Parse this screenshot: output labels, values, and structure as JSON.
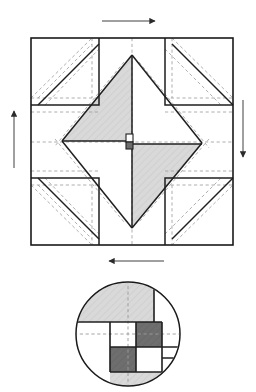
{
  "figure": {
    "title": "Quilt block piecing diagram with rotation arrows and circular detail inset",
    "width": 256,
    "height": 392,
    "background_color": "#ffffff"
  },
  "colors": {
    "outline": "#1a1a1a",
    "seam_solid": "#2b2b2b",
    "seam_dashed": "#8c8c8c",
    "fabric_light": "#ffffff",
    "fabric_medium": "#d9d9d9",
    "fabric_dark": "#6e6e6e",
    "arrow": "#2b2b2b",
    "hatch": "#c2c2c2"
  },
  "main_block": {
    "name": "pinwheel-square-in-a-square-block",
    "x": 31,
    "y": 38,
    "width": 202,
    "height": 207,
    "grid_divisions": 3,
    "outline_width": 1.6,
    "grid_lines": {
      "vertical_x": [
        99,
        165
      ],
      "horizontal_y": [
        105,
        178
      ]
    },
    "center_marks": {
      "vertical_x": 132,
      "horizontal_y": 142
    },
    "units": [
      {
        "name": "corner-unit-top-left",
        "x": 31,
        "y": 38,
        "w": 68,
        "h": 67,
        "type": "half-square-triangle",
        "diagonal": "bottom-left-to-top-right",
        "fill": "#ffffff"
      },
      {
        "name": "corner-unit-top-right",
        "x": 165,
        "y": 38,
        "w": 68,
        "h": 67,
        "type": "half-square-triangle",
        "diagonal": "top-left-to-bottom-right",
        "fill": "#ffffff"
      },
      {
        "name": "corner-unit-bottom-left",
        "x": 31,
        "y": 178,
        "w": 68,
        "h": 67,
        "type": "half-square-triangle",
        "diagonal": "top-left-to-bottom-right",
        "fill": "#ffffff"
      },
      {
        "name": "corner-unit-bottom-right",
        "x": 165,
        "y": 178,
        "w": 68,
        "h": 67,
        "type": "half-square-triangle",
        "diagonal": "bottom-left-to-top-right",
        "fill": "#ffffff"
      },
      {
        "name": "shaded-triangle-upper",
        "type": "large-triangle",
        "fill": "#d9d9d9",
        "points": "132,55 132,141 62,141"
      },
      {
        "name": "shaded-triangle-lower",
        "type": "large-triangle",
        "fill": "#d9d9d9",
        "points": "132,144 202,144 132,228"
      },
      {
        "name": "center-square-on-point",
        "type": "square-on-point",
        "fill": "#ffffff",
        "points": "132,55 202,143 132,228 62,141"
      },
      {
        "name": "center-patch-light",
        "type": "tiny-square",
        "x": 126,
        "y": 134,
        "w": 7,
        "h": 8,
        "fill": "#ffffff"
      },
      {
        "name": "center-patch-dark",
        "type": "tiny-square",
        "x": 126,
        "y": 142,
        "w": 7,
        "h": 7,
        "fill": "#6e6e6e"
      }
    ]
  },
  "arrows": [
    {
      "name": "arrow-top",
      "direction": "right",
      "label": "press toward right",
      "x1": 102,
      "y1": 21,
      "x2": 158,
      "y2": 21
    },
    {
      "name": "arrow-right",
      "direction": "down",
      "label": "press downward",
      "x1": 243,
      "y1": 100,
      "x2": 243,
      "y2": 160
    },
    {
      "name": "arrow-bottom",
      "direction": "left",
      "label": "press toward left",
      "x1": 164,
      "y1": 261,
      "x2": 106,
      "y2": 261
    },
    {
      "name": "arrow-left",
      "direction": "up",
      "label": "press upward",
      "x1": 14,
      "y1": 168,
      "x2": 14,
      "y2": 108
    }
  ],
  "detail_inset": {
    "name": "center-intersection-detail",
    "shape": "circle",
    "cx": 128,
    "cy": 334,
    "r": 52,
    "crosshair": {
      "vertical_x": 128,
      "horizontal_y": 334
    },
    "patches": [
      {
        "name": "detail-patch-top-left",
        "x": 76,
        "y": 282,
        "w": 52,
        "h": 40,
        "fill": "#d9d9d9"
      },
      {
        "name": "detail-patch-top-right",
        "x": 128,
        "y": 282,
        "w": 26,
        "h": 40,
        "fill": "#d9d9d9"
      },
      {
        "name": "detail-patch-top-far-right",
        "x": 154,
        "y": 282,
        "w": 30,
        "h": 40,
        "fill": "#ffffff"
      },
      {
        "name": "detail-patch-mid-left",
        "x": 72,
        "y": 322,
        "w": 38,
        "h": 25,
        "fill": "#ffffff"
      },
      {
        "name": "detail-patch-center-upper-left",
        "x": 110,
        "y": 322,
        "w": 26,
        "h": 25,
        "fill": "#ffffff"
      },
      {
        "name": "detail-patch-center-upper-right",
        "x": 136,
        "y": 322,
        "w": 26,
        "h": 25,
        "fill": "#6e6e6e"
      },
      {
        "name": "detail-patch-mid-right",
        "x": 162,
        "y": 322,
        "w": 22,
        "h": 25,
        "fill": "#ffffff"
      },
      {
        "name": "detail-patch-center-lower-left",
        "x": 110,
        "y": 347,
        "w": 26,
        "h": 25,
        "fill": "#6e6e6e"
      },
      {
        "name": "detail-patch-center-lower-right",
        "x": 136,
        "y": 347,
        "w": 26,
        "h": 25,
        "fill": "#ffffff"
      },
      {
        "name": "detail-patch-lower-left",
        "x": 74,
        "y": 347,
        "w": 36,
        "h": 39,
        "fill": "#ffffff"
      },
      {
        "name": "detail-patch-lower-right",
        "x": 162,
        "y": 347,
        "w": 22,
        "h": 10,
        "fill": "#ffffff"
      },
      {
        "name": "detail-patch-bottom",
        "x": 110,
        "y": 372,
        "w": 74,
        "h": 16,
        "fill": "#d9d9d9"
      }
    ]
  }
}
